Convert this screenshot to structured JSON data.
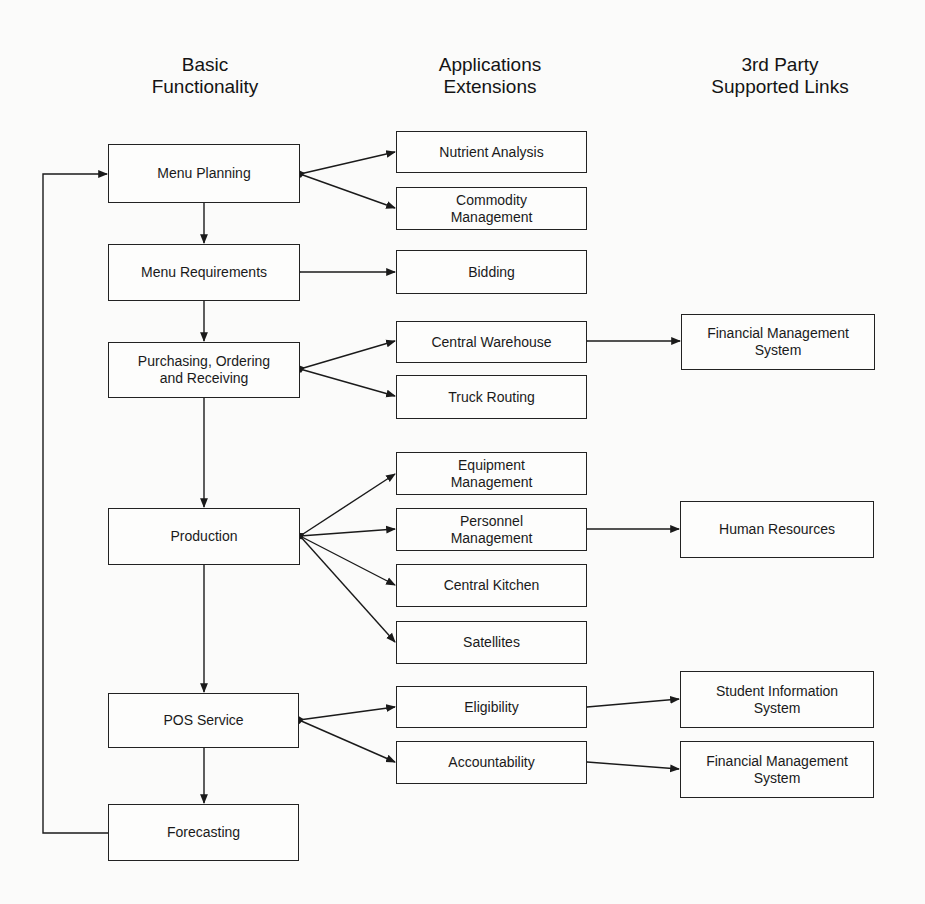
{
  "headers": {
    "basic": "Basic\nFunctionality",
    "apps": "Applications\nExtensions",
    "third": "3rd Party\nSupported Links"
  },
  "basic_functionality": [
    {
      "id": "menu-planning",
      "label": "Menu Planning"
    },
    {
      "id": "menu-requirements",
      "label": "Menu Requirements"
    },
    {
      "id": "purchasing",
      "label": "Purchasing, Ordering\nand Receiving"
    },
    {
      "id": "production",
      "label": "Production"
    },
    {
      "id": "pos-service",
      "label": "POS Service"
    },
    {
      "id": "forecasting",
      "label": "Forecasting"
    }
  ],
  "applications_extensions": [
    {
      "id": "nutrient-analysis",
      "label": "Nutrient Analysis"
    },
    {
      "id": "commodity-management",
      "label": "Commodity\nManagement"
    },
    {
      "id": "bidding",
      "label": "Bidding"
    },
    {
      "id": "central-warehouse",
      "label": "Central Warehouse"
    },
    {
      "id": "truck-routing",
      "label": "Truck Routing"
    },
    {
      "id": "equipment-management",
      "label": "Equipment\nManagement"
    },
    {
      "id": "personnel-management",
      "label": "Personnel\nManagement"
    },
    {
      "id": "central-kitchen",
      "label": "Central Kitchen"
    },
    {
      "id": "satellites",
      "label": "Satellites"
    },
    {
      "id": "eligibility",
      "label": "Eligibility"
    },
    {
      "id": "accountability",
      "label": "Accountability"
    }
  ],
  "third_party_links": [
    {
      "id": "financial-management-1",
      "label": "Financial Management\nSystem"
    },
    {
      "id": "human-resources",
      "label": "Human Resources"
    },
    {
      "id": "student-information",
      "label": "Student Information\nSystem"
    },
    {
      "id": "financial-management-2",
      "label": "Financial Management\nSystem"
    }
  ],
  "connections": [
    {
      "from": "menu-planning",
      "to": "menu-requirements"
    },
    {
      "from": "menu-requirements",
      "to": "purchasing"
    },
    {
      "from": "purchasing",
      "to": "production"
    },
    {
      "from": "production",
      "to": "pos-service"
    },
    {
      "from": "pos-service",
      "to": "forecasting"
    },
    {
      "from": "forecasting",
      "to": "menu-planning"
    },
    {
      "from": "menu-planning",
      "to": "nutrient-analysis"
    },
    {
      "from": "menu-planning",
      "to": "commodity-management"
    },
    {
      "from": "menu-requirements",
      "to": "bidding"
    },
    {
      "from": "purchasing",
      "to": "central-warehouse"
    },
    {
      "from": "purchasing",
      "to": "truck-routing"
    },
    {
      "from": "production",
      "to": "equipment-management"
    },
    {
      "from": "production",
      "to": "personnel-management"
    },
    {
      "from": "production",
      "to": "central-kitchen"
    },
    {
      "from": "production",
      "to": "satellites"
    },
    {
      "from": "pos-service",
      "to": "eligibility"
    },
    {
      "from": "pos-service",
      "to": "accountability"
    },
    {
      "from": "central-warehouse",
      "to": "financial-management-1"
    },
    {
      "from": "personnel-management",
      "to": "human-resources"
    },
    {
      "from": "eligibility",
      "to": "student-information"
    },
    {
      "from": "accountability",
      "to": "financial-management-2"
    }
  ]
}
